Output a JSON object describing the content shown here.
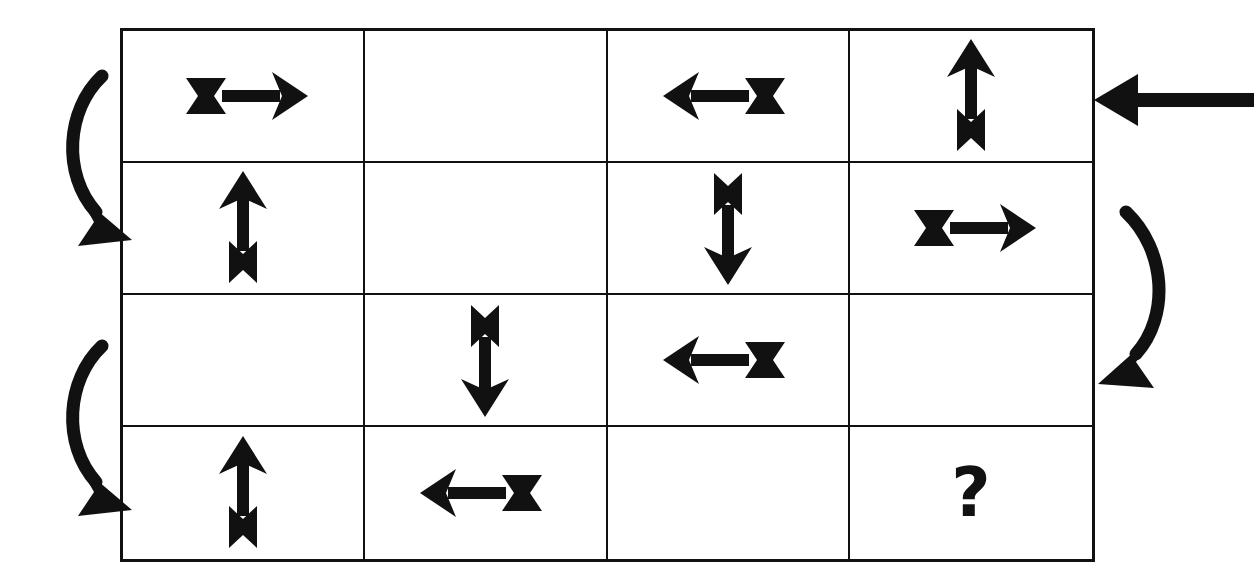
{
  "puzzle": {
    "title": "Arrow Sequence Matrix Puzzle",
    "grid": {
      "rows": 4,
      "columns": 4,
      "border_color": "#111111",
      "background_color": "#ffffff",
      "cells": [
        [
          {
            "id": "r1c1",
            "type": "arrow",
            "direction": "right",
            "label": "right arrow"
          },
          {
            "id": "r1c2",
            "type": "empty",
            "direction": "none",
            "label": "empty cell"
          },
          {
            "id": "r1c3",
            "type": "arrow",
            "direction": "left",
            "label": "left arrow"
          },
          {
            "id": "r1c4",
            "type": "arrow",
            "direction": "up",
            "label": "up arrow"
          }
        ],
        [
          {
            "id": "r2c1",
            "type": "arrow",
            "direction": "up",
            "label": "up arrow"
          },
          {
            "id": "r2c2",
            "type": "empty",
            "direction": "none",
            "label": "empty cell"
          },
          {
            "id": "r2c3",
            "type": "arrow",
            "direction": "down",
            "label": "down arrow"
          },
          {
            "id": "r2c4",
            "type": "arrow",
            "direction": "right",
            "label": "right arrow"
          }
        ],
        [
          {
            "id": "r3c1",
            "type": "empty",
            "direction": "none",
            "label": "empty cell"
          },
          {
            "id": "r3c2",
            "type": "arrow",
            "direction": "down",
            "label": "down arrow"
          },
          {
            "id": "r3c3",
            "type": "arrow",
            "direction": "left",
            "label": "left arrow"
          },
          {
            "id": "r3c4",
            "type": "empty",
            "direction": "none",
            "label": "empty cell"
          }
        ],
        [
          {
            "id": "r4c1",
            "type": "arrow",
            "direction": "up",
            "label": "up arrow"
          },
          {
            "id": "r4c2",
            "type": "arrow",
            "direction": "left",
            "label": "left arrow"
          },
          {
            "id": "r4c3",
            "type": "empty",
            "direction": "none",
            "label": "empty cell"
          },
          {
            "id": "r4c4",
            "type": "question",
            "direction": "none",
            "label": "question mark",
            "text": "?"
          }
        ]
      ]
    },
    "markers": [
      {
        "id": "flow-left-upper",
        "type": "curved-arrow",
        "shape": "bows-left-points-down-right",
        "label": "curved flow arrow from row 1 to row 2"
      },
      {
        "id": "flow-left-lower",
        "type": "curved-arrow",
        "shape": "bows-left-points-down-right",
        "label": "curved flow arrow from row 3 to row 4"
      },
      {
        "id": "flow-right-mid",
        "type": "curved-arrow",
        "shape": "bows-right-points-down-left",
        "label": "curved flow arrow from row 2 to row 3"
      },
      {
        "id": "pointer-right-top",
        "type": "straight-arrow",
        "direction": "left",
        "label": "pointer arrow indicating start of row 1"
      }
    ],
    "answer_placeholder": "?",
    "ink_color": "#111111"
  }
}
